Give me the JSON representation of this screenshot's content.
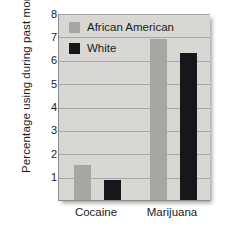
{
  "chart_data": {
    "type": "bar",
    "title": "",
    "xlabel": "",
    "ylabel_line1": "Percentage using",
    "ylabel_line2": "during past month",
    "categories": [
      "Cocaine",
      "Marijuana"
    ],
    "series": [
      {
        "name": "African American",
        "color": "#a8a6a3",
        "values": [
          1.5,
          6.9
        ]
      },
      {
        "name": "White",
        "color": "#17161a",
        "values": [
          0.85,
          6.3
        ]
      }
    ],
    "ylim": [
      0,
      8
    ],
    "yticks": [
      1,
      2,
      3,
      4,
      5,
      6,
      7,
      8
    ],
    "ytick_labels": [
      "1",
      "2",
      "3",
      "4",
      "5",
      "6",
      "7",
      "8"
    ],
    "grid": true,
    "grid_orientation": "horizontal",
    "legend_position": "top-left-inside",
    "plot_background": "#d9d7d4",
    "axis_color": "#8e8c89",
    "gridline_color": "#a9a7a4",
    "text_color": "#1b1b1b"
  }
}
